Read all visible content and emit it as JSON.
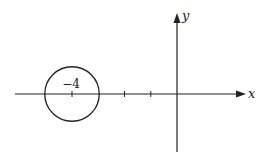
{
  "diagram": {
    "x_axis_label": "x",
    "y_axis_label": "y",
    "unit_ticks": [
      -1,
      -2,
      -4
    ],
    "circle": {
      "center": -4,
      "radius": 1,
      "label": "−4"
    },
    "color": "#222222"
  }
}
